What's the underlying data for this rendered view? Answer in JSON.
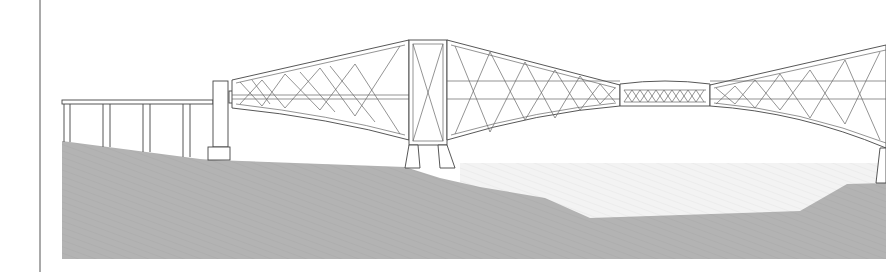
{
  "figure": {
    "colors": {
      "background": "#ffffff",
      "line": "#444444",
      "ground": "#b3b3b3",
      "water": "#f1f1f1",
      "frame_border": "#555555"
    },
    "elements": {
      "left_approach": {
        "piers": 4,
        "deck_y": 102
      },
      "abutment": {
        "x": 213,
        "width": 15
      },
      "main_tower": {
        "x": 409,
        "width": 38
      },
      "suspended_span": {
        "x_start": 620,
        "x_end": 710
      },
      "ground_profile": [
        [
          62,
          141
        ],
        [
          200,
          159
        ],
        [
          215,
          160
        ],
        [
          405,
          167
        ],
        [
          440,
          178
        ],
        [
          480,
          187
        ],
        [
          545,
          198
        ],
        [
          590,
          218
        ],
        [
          800,
          211
        ],
        [
          847,
          184
        ],
        [
          886,
          183
        ]
      ]
    }
  }
}
